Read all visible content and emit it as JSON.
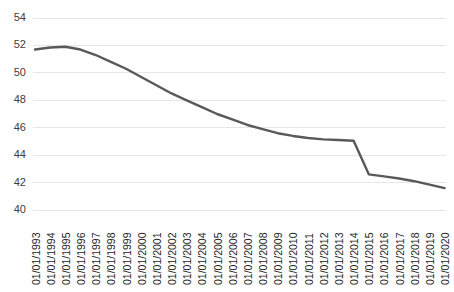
{
  "chart_data": {
    "type": "line",
    "title": "",
    "xlabel": "",
    "ylabel": "",
    "ylim": [
      40,
      54
    ],
    "ytick_step": 2,
    "grid": true,
    "legend": false,
    "line_color": "#595959",
    "grid_color": "#e6e6e6",
    "background_color": "#ffffff",
    "ytick_labels": [
      "54",
      "52",
      "50",
      "48",
      "46",
      "44",
      "42",
      "40"
    ],
    "ytick_values": [
      54,
      52,
      50,
      48,
      46,
      44,
      42,
      40
    ],
    "categories": [
      "01/01/1993",
      "01/01/1994",
      "01/01/1995",
      "01/01/1996",
      "01/01/1997",
      "01/01/1998",
      "01/01/1999",
      "01/01/2000",
      "01/01/2001",
      "01/01/2002",
      "01/01/2003",
      "01/01/2004",
      "01/01/2005",
      "01/01/2006",
      "01/01/2007",
      "01/01/2008",
      "01/01/2009",
      "01/01/2010",
      "01/01/2011",
      "01/01/2012",
      "01/01/2013",
      "01/01/2014",
      "01/01/2015",
      "01/01/2016",
      "01/01/2017",
      "01/01/2018",
      "01/01/2019",
      "01/01/2020"
    ],
    "values": [
      51.7,
      51.85,
      51.9,
      51.7,
      51.3,
      50.8,
      50.3,
      49.7,
      49.1,
      48.5,
      48.0,
      47.5,
      47.0,
      46.6,
      46.2,
      45.9,
      45.6,
      45.4,
      45.25,
      45.15,
      45.1,
      45.05,
      42.6,
      42.45,
      42.3,
      42.1,
      41.85,
      41.6
    ]
  }
}
